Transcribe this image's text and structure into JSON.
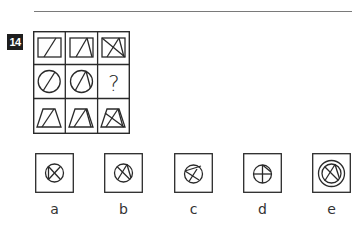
{
  "question": {
    "number": "14",
    "grid": {
      "rows": 3,
      "cols": 3,
      "cells": [
        {
          "row": 1,
          "col": 1,
          "figure": "rectangle with one diagonal line"
        },
        {
          "row": 1,
          "col": 2,
          "figure": "rectangle with two lines forming peak"
        },
        {
          "row": 1,
          "col": 3,
          "figure": "rectangle with crossed lines"
        },
        {
          "row": 2,
          "col": 1,
          "figure": "circle with one diagonal line"
        },
        {
          "row": 2,
          "col": 2,
          "figure": "circle with two lines forming peak"
        },
        {
          "row": 2,
          "col": 3,
          "figure": "missing",
          "text": "?"
        },
        {
          "row": 3,
          "col": 1,
          "figure": "trapezoid with one diagonal line"
        },
        {
          "row": 3,
          "col": 2,
          "figure": "trapezoid with two lines forming peak"
        },
        {
          "row": 3,
          "col": 3,
          "figure": "trapezoid with crossed lines"
        }
      ]
    },
    "options": [
      {
        "label": "a",
        "figure": "circle with X and vertical chord"
      },
      {
        "label": "b",
        "figure": "circle with X and peak lines"
      },
      {
        "label": "c",
        "figure": "circle with arrow-like lines"
      },
      {
        "label": "d",
        "figure": "circle with cross and chord"
      },
      {
        "label": "e",
        "figure": "double circle with X and peak lines"
      }
    ]
  },
  "colors": {
    "stroke": "#2a2a2a",
    "badge_bg": "#1e1e1e",
    "rule": "#7a7a7a"
  }
}
